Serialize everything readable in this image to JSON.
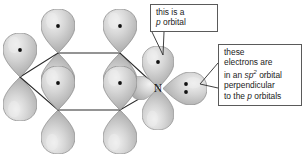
{
  "figure": {
    "background_color": "#ffffff",
    "orbital_fill": "#b9b9b9",
    "orbital_highlight": "#e8e8e8",
    "orbital_outline": "#8d8d8d",
    "bond_color": "#2b2b2b",
    "electron_dot_color": "#111111"
  },
  "atoms": [
    {
      "id": "c1",
      "label": "",
      "x": 20,
      "y": 77,
      "kind": "carbon",
      "p_orbital_dots": 1
    },
    {
      "id": "c2",
      "label": "",
      "x": 58,
      "y": 53,
      "kind": "carbon",
      "p_orbital_dots": 1
    },
    {
      "id": "c3",
      "label": "",
      "x": 120,
      "y": 53,
      "kind": "carbon",
      "p_orbital_dots": 1
    },
    {
      "id": "n1",
      "label": "N",
      "x": 158,
      "y": 88,
      "kind": "nitrogen",
      "p_orbital_dots": 1,
      "sp2_lone_pair_dots": 2
    },
    {
      "id": "c5",
      "label": "",
      "x": 120,
      "y": 110,
      "kind": "carbon",
      "p_orbital_dots": 1
    },
    {
      "id": "c6",
      "label": "",
      "x": 58,
      "y": 110,
      "kind": "carbon",
      "p_orbital_dots": 1
    }
  ],
  "ring": {
    "name": "pyridine-ring",
    "vertices": "20,77 58,53 120,53 158,88 120,110 58,110"
  },
  "callouts": {
    "p_orbital": {
      "line1": "this is a",
      "line2_italic": "p",
      "line2_rest": " orbital"
    },
    "sp2_orbital": {
      "line1": "these",
      "line2": "electrons are",
      "line3_pre": "in an ",
      "line3_italic": "sp",
      "line3_sup": "2",
      "line3_post": " orbital",
      "line4": "perpendicular",
      "line5_pre": "to the ",
      "line5_italic": "p",
      "line5_post": " orbitals"
    }
  },
  "nitrogen_label": "N"
}
